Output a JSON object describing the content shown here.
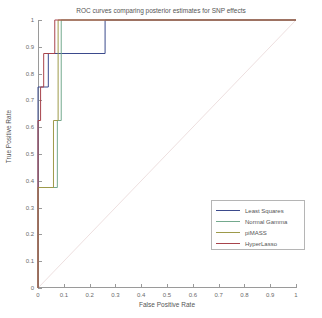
{
  "chart_data": {
    "type": "line",
    "title": "ROC curves comparing posterior estimates for SNP effects",
    "xlabel": "False Positive Rate",
    "ylabel": "True Positive Rate",
    "xlim": [
      0,
      1
    ],
    "ylim": [
      0,
      1
    ],
    "grid": false,
    "legend_position": "lower-right",
    "xticks": [
      "0",
      "0.1",
      "0.2",
      "0.3",
      "0.4",
      "0.5",
      "0.6",
      "0.7",
      "0.8",
      "0.9",
      "1"
    ],
    "xtick_values": [
      0,
      0.1,
      0.2,
      0.3,
      0.4,
      0.5,
      0.6,
      0.7,
      0.8,
      0.9,
      1
    ],
    "yticks": [
      "0",
      "0.1",
      "0.2",
      "0.3",
      "0.4",
      "0.5",
      "0.6",
      "0.7",
      "0.8",
      "0.9",
      "1"
    ],
    "ytick_values": [
      0,
      0.1,
      0.2,
      0.3,
      0.4,
      0.5,
      0.6,
      0.7,
      0.8,
      0.9,
      1
    ],
    "reference_line": {
      "name": "chance-diagonal",
      "x": [
        0,
        1
      ],
      "y": [
        0,
        1
      ],
      "color": "#e8d7d7"
    },
    "series": [
      {
        "name": "Least Squares",
        "color": "#3b4a8c",
        "x": [
          0.0,
          0.0,
          0.016,
          0.016,
          0.04,
          0.04,
          0.26,
          0.26,
          1.0
        ],
        "y": [
          0.0,
          0.75,
          0.75,
          0.75,
          0.75,
          0.875,
          0.875,
          1.0,
          1.0
        ]
      },
      {
        "name": "Normal Gamma",
        "color": "#74a98e",
        "x": [
          0.0,
          0.0,
          0.075,
          0.075,
          0.09,
          0.09,
          1.0
        ],
        "y": [
          0.0,
          0.375,
          0.375,
          0.625,
          0.625,
          1.0,
          1.0
        ]
      },
      {
        "name": "piMASS",
        "color": "#9d9a4a",
        "x": [
          0.0,
          0.0,
          0.06,
          0.06,
          0.078,
          0.078,
          1.0
        ],
        "y": [
          0.0,
          0.375,
          0.375,
          0.625,
          0.625,
          1.0,
          1.0
        ]
      },
      {
        "name": "HyperLasso",
        "color": "#a8444c",
        "x": [
          0.0,
          0.0,
          0.01,
          0.01,
          0.022,
          0.022,
          0.065,
          0.065,
          1.0
        ],
        "y": [
          0.0,
          0.625,
          0.625,
          0.75,
          0.75,
          0.875,
          0.875,
          1.0,
          1.0
        ]
      }
    ]
  },
  "legend": {
    "entries": [
      {
        "label": "Least Squares",
        "color": "#3b4a8c"
      },
      {
        "label": "Normal Gamma",
        "color": "#74a98e"
      },
      {
        "label": "piMASS",
        "color": "#9d9a4a"
      },
      {
        "label": "HyperLasso",
        "color": "#a8444c"
      }
    ]
  }
}
